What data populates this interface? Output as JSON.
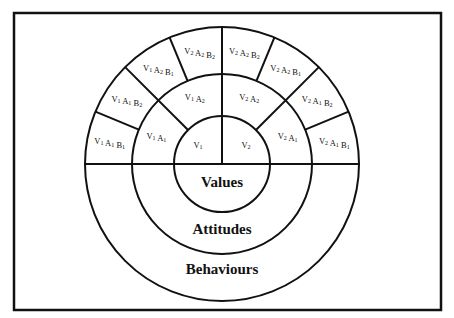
{
  "diagram": {
    "center": {
      "x": 222,
      "y": 164
    },
    "radii": {
      "values": 48,
      "attitudes": 90,
      "behaviours": 137
    },
    "frame": {
      "x": 14,
      "y": 13,
      "width": 427,
      "height": 297
    },
    "colors": {
      "line": "#111111",
      "background": "#ffffff"
    },
    "rings": {
      "values_label": "Values",
      "attitudes_label": "Attitudes",
      "behaviours_label": "Behaviours"
    },
    "inner_cells": [
      {
        "id": "v1",
        "parts": [
          [
            "V",
            "1"
          ]
        ],
        "angle": 135
      },
      {
        "id": "v2",
        "parts": [
          [
            "V",
            "2"
          ]
        ],
        "angle": 45
      }
    ],
    "middle_cells": [
      {
        "id": "v1a1",
        "parts": [
          [
            "V",
            "1"
          ],
          [
            "A",
            "1"
          ]
        ],
        "angle": 157.5
      },
      {
        "id": "v1a2",
        "parts": [
          [
            "V",
            "1"
          ],
          [
            "A",
            "2"
          ]
        ],
        "angle": 112.5
      },
      {
        "id": "v2a2",
        "parts": [
          [
            "V",
            "2"
          ],
          [
            "A",
            "2"
          ]
        ],
        "angle": 67.5
      },
      {
        "id": "v2a1",
        "parts": [
          [
            "V",
            "2"
          ],
          [
            "A",
            "1"
          ]
        ],
        "angle": 22.5
      }
    ],
    "outer_cells": [
      {
        "id": "v1a1b1",
        "parts": [
          [
            "V",
            "1"
          ],
          [
            "A",
            "1"
          ],
          [
            "B",
            "1"
          ]
        ],
        "angle": 168.75
      },
      {
        "id": "v1a1b2",
        "parts": [
          [
            "V",
            "1"
          ],
          [
            "A",
            "1"
          ],
          [
            "B",
            "2"
          ]
        ],
        "angle": 146.25
      },
      {
        "id": "v1a2b1",
        "parts": [
          [
            "V",
            "1"
          ],
          [
            "A",
            "2"
          ],
          [
            "B",
            "1"
          ]
        ],
        "angle": 123.75
      },
      {
        "id": "v2a2b2-left",
        "parts": [
          [
            "V",
            "2"
          ],
          [
            "A",
            "2"
          ],
          [
            "B",
            "2"
          ]
        ],
        "angle": 101.25
      },
      {
        "id": "v2a2b2",
        "parts": [
          [
            "V",
            "2"
          ],
          [
            "A",
            "2"
          ],
          [
            "B",
            "2"
          ]
        ],
        "angle": 78.75
      },
      {
        "id": "v2a2b1",
        "parts": [
          [
            "V",
            "2"
          ],
          [
            "A",
            "2"
          ],
          [
            "B",
            "1"
          ]
        ],
        "angle": 56.25
      },
      {
        "id": "v2a1b2",
        "parts": [
          [
            "V",
            "2"
          ],
          [
            "A",
            "1"
          ],
          [
            "B",
            "2"
          ]
        ],
        "angle": 33.75
      },
      {
        "id": "v2a1b1",
        "parts": [
          [
            "V",
            "2"
          ],
          [
            "A",
            "1"
          ],
          [
            "B",
            "1"
          ]
        ],
        "angle": 11.25
      }
    ],
    "middle_dividers_deg": [
      45,
      135
    ],
    "outer_dividers_deg": [
      22.5,
      45,
      67.5,
      112.5,
      135,
      157.5
    ]
  }
}
